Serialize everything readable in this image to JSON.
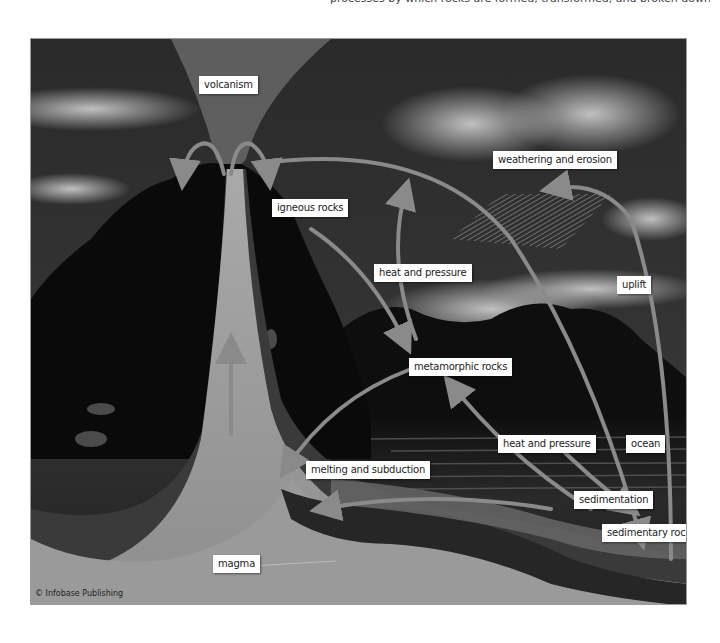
{
  "caption": {
    "top_text": "processes by which rocks are formed, transformed, and broken down over time into sedimentary rocks."
  },
  "diagram": {
    "labels": {
      "volcanism": "volcanism",
      "igneous_rocks": "igneous rocks",
      "weathering_and_erosion": "weathering and erosion",
      "heat_and_pressure_upper": "heat and pressure",
      "uplift": "uplift",
      "metamorphic_rocks": "metamorphic rocks",
      "heat_and_pressure_lower": "heat and pressure",
      "ocean": "ocean",
      "melting_and_subduction": "melting and subduction",
      "sedimentation": "sedimentation",
      "sedimentary_rocks": "sedimentary rocks",
      "magma": "magma"
    },
    "credit": "© Infobase Publishing",
    "colors": {
      "sky_dark": "#2e2e2e",
      "cloud": "#bdbdbd",
      "mountain": "#0d0d0d",
      "crust": "#3b3b3b",
      "magma": "#9c9c9c",
      "conduit": "#b4b4b4",
      "arrow": "#8a8a8a",
      "ocean": "#1a1a1a"
    }
  }
}
